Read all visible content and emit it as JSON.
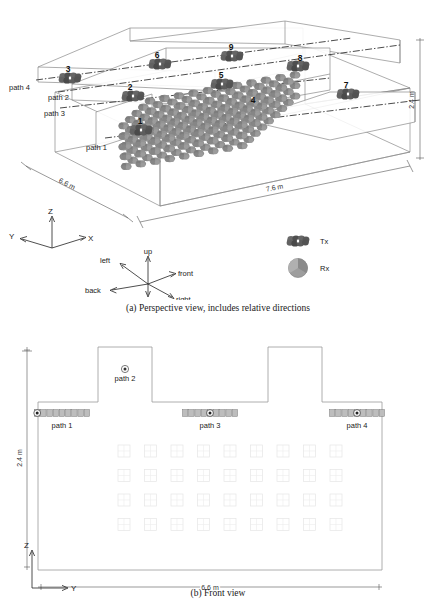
{
  "figure": {
    "panel_a": {
      "caption": "(a) Perspective view, includes relative directions",
      "dimensions": [
        {
          "name": "length",
          "label": "7.6 m"
        },
        {
          "name": "depth",
          "label": "6.6 m"
        },
        {
          "name": "height",
          "label": "2.4 m"
        }
      ],
      "axes": {
        "x": "X",
        "y": "Y",
        "z": "Z"
      },
      "relative_directions": {
        "up": "up",
        "down": "down",
        "left": "left",
        "right": "right",
        "front": "front",
        "back": "back"
      },
      "node_numbers": [
        "1",
        "2",
        "3",
        "4",
        "5",
        "6",
        "7",
        "8",
        "9"
      ],
      "path_labels": [
        "path 1",
        "path 2",
        "path 3",
        "path 4"
      ],
      "legend": [
        {
          "key": "tx",
          "label": "Tx"
        },
        {
          "key": "rx",
          "label": "Rx"
        }
      ]
    },
    "panel_b": {
      "caption": "(b) Front view",
      "dimensions": [
        {
          "name": "width",
          "label": "6.6 m"
        },
        {
          "name": "height",
          "label": "2.4 m"
        }
      ],
      "axes": {
        "y": "Y",
        "z": "Z"
      },
      "path_labels": [
        "path 1",
        "path 2",
        "path 3",
        "path 4"
      ],
      "grid": {
        "cols": 9,
        "rows": 4
      }
    }
  },
  "colors": {
    "outline": "#8a8a8a",
    "centerline": "#2b2b2b",
    "node_dark": "#555555",
    "node_light": "#9a9a9a",
    "grid_faint": "#e2e2e2",
    "text": "#1a1a1a"
  }
}
